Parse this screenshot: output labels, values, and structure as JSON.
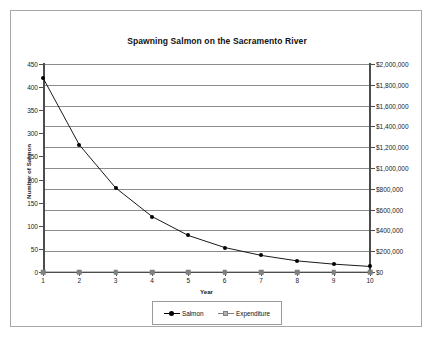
{
  "chart_data": {
    "type": "line",
    "title": "Spawning Salmon on the Sacramento River",
    "xlabel": "Year",
    "ylabel": "Number of Salmon",
    "y2label": "",
    "grid": true,
    "legend_position": "bottom",
    "x": [
      1,
      2,
      3,
      4,
      5,
      6,
      7,
      8,
      9,
      10
    ],
    "categories": [
      "1",
      "2",
      "3",
      "4",
      "5",
      "6",
      "7",
      "8",
      "9",
      "10"
    ],
    "xtick_labels": [
      "1",
      "2",
      "3",
      "4",
      "5",
      "6",
      "7",
      "8",
      "9",
      "10"
    ],
    "ylim": [
      0,
      450
    ],
    "ytick_labels": [
      "0",
      "50",
      "100",
      "150",
      "200",
      "250",
      "300",
      "350",
      "400",
      "450"
    ],
    "ytick_values": [
      0,
      50,
      100,
      150,
      200,
      250,
      300,
      350,
      400,
      450
    ],
    "y2lim": [
      0,
      2000000
    ],
    "y2tick_labels": [
      "$0",
      "$200,000",
      "$400,000",
      "$600,000",
      "$800,000",
      "$1,000,000",
      "$1,200,000",
      "$1,400,000",
      "$1,600,000",
      "$1,800,000",
      "$2,000,000"
    ],
    "y2tick_values": [
      0,
      200000,
      400000,
      600000,
      800000,
      1000000,
      1200000,
      1400000,
      1600000,
      1800000,
      2000000
    ],
    "series": [
      {
        "name": "Salmon",
        "axis": "left",
        "color": "#000000",
        "marker": "filled-circle",
        "values": [
          420,
          275,
          182,
          120,
          79,
          53,
          36,
          24,
          17,
          12
        ]
      },
      {
        "name": "Expenditure",
        "axis": "right",
        "color": "#808080",
        "marker": "filled-square",
        "values": [
          0,
          0,
          0,
          0,
          0,
          0,
          0,
          0,
          0,
          0
        ]
      }
    ],
    "legend": [
      "Salmon",
      "Expenditure"
    ]
  },
  "colors": {
    "salmon_series": "#000000",
    "expenditure_series": "#808080",
    "gridline": "#8c8c8c",
    "axis": "#4d4d4d",
    "frame_border": "#a6a6a6",
    "background": "#ffffff"
  }
}
